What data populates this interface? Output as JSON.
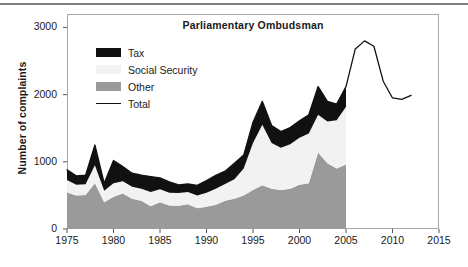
{
  "figure": {
    "title": "Parliamentary Ombudsman",
    "ylabel": "Number of complaints"
  },
  "legend": {
    "items": [
      {
        "label": "Tax",
        "color": "#111111",
        "kind": "area"
      },
      {
        "label": "Social Security",
        "color": "#f2f2f2",
        "kind": "area"
      },
      {
        "label": "Other",
        "color": "#9a9a9a",
        "kind": "area"
      },
      {
        "label": "Total",
        "color": "#111111",
        "kind": "line"
      }
    ]
  },
  "axes": {
    "x_ticks": [
      "1975",
      "1980",
      "1985",
      "1990",
      "1995",
      "2000",
      "2005",
      "2010",
      "2015"
    ],
    "y_ticks": [
      "0",
      "1000",
      "2000",
      "3000"
    ]
  },
  "chart_data": {
    "type": "area",
    "title": "Parliamentary Ombudsman",
    "xlabel": "",
    "ylabel": "Number of complaints",
    "xlim": [
      1975,
      2015
    ],
    "ylim": [
      0,
      3200
    ],
    "grid": false,
    "legend_position": "upper-left-inside",
    "stacked": true,
    "stack_order": [
      "Other",
      "Social Security",
      "Tax"
    ],
    "x": [
      1975,
      1976,
      1977,
      1978,
      1979,
      1980,
      1981,
      1982,
      1983,
      1984,
      1985,
      1986,
      1987,
      1988,
      1989,
      1990,
      1991,
      1992,
      1993,
      1994,
      1995,
      1996,
      1997,
      1998,
      1999,
      2000,
      2001,
      2002,
      2003,
      2004,
      2005
    ],
    "series": [
      {
        "name": "Other",
        "color": "#9a9a9a",
        "values": [
          545,
          500,
          505,
          680,
          400,
          480,
          530,
          450,
          420,
          340,
          400,
          350,
          345,
          370,
          310,
          330,
          360,
          420,
          450,
          500,
          580,
          650,
          600,
          580,
          600,
          660,
          680,
          1140,
          980,
          900,
          960
        ]
      },
      {
        "name": "Social Security",
        "color": "#f2f2f2",
        "values": [
          185,
          160,
          160,
          270,
          170,
          200,
          180,
          180,
          180,
          210,
          190,
          190,
          190,
          180,
          190,
          210,
          240,
          250,
          290,
          400,
          700,
          900,
          680,
          630,
          660,
          700,
          740,
          560,
          620,
          720,
          860
        ]
      },
      {
        "name": "Tax",
        "color": "#111111",
        "values": [
          150,
          130,
          135,
          300,
          110,
          340,
          220,
          200,
          200,
          230,
          170,
          160,
          120,
          120,
          150,
          180,
          200,
          190,
          240,
          200,
          310,
          350,
          260,
          240,
          250,
          250,
          280,
          420,
          300,
          240,
          300
        ]
      }
    ],
    "total_line": {
      "name": "Total",
      "color": "#111111",
      "x": [
        1975,
        1976,
        1977,
        1978,
        1979,
        1980,
        1981,
        1982,
        1983,
        1984,
        1985,
        1986,
        1987,
        1988,
        1989,
        1990,
        1991,
        1992,
        1993,
        1994,
        1995,
        1996,
        1997,
        1998,
        1999,
        2000,
        2001,
        2002,
        2003,
        2004,
        2005,
        2006,
        2007,
        2008,
        2009,
        2010,
        2011,
        2012
      ],
      "values": [
        880,
        790,
        800,
        1250,
        680,
        1020,
        930,
        830,
        800,
        780,
        760,
        700,
        655,
        670,
        650,
        720,
        800,
        860,
        980,
        1100,
        1590,
        1900,
        1540,
        1450,
        1510,
        1610,
        1700,
        2120,
        1900,
        1860,
        2120,
        2680,
        2800,
        2720,
        2200,
        1950,
        1930,
        1990
      ]
    }
  }
}
